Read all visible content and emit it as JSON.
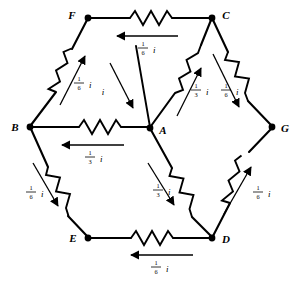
{
  "figure": {
    "type": "circuit-diagram",
    "background_color": "#ffffff",
    "line_color": "#000000"
  },
  "nodes": [
    {
      "id": "F",
      "label": "F",
      "x": 88,
      "y": 18,
      "label_dx": -13,
      "label_dy": -2
    },
    {
      "id": "C",
      "label": "C",
      "x": 212,
      "y": 18,
      "label_dx": 8,
      "label_dy": -2
    },
    {
      "id": "B",
      "label": "B",
      "x": 30,
      "y": 127,
      "label_dx": -13,
      "label_dy": 2
    },
    {
      "id": "A",
      "label": "A",
      "x": 150,
      "y": 128,
      "label_dx": 8,
      "label_dy": 4
    },
    {
      "id": "G",
      "label": "G",
      "x": 272,
      "y": 127,
      "label_dx": 8,
      "label_dy": 3
    },
    {
      "id": "E",
      "label": "E",
      "x": 88,
      "y": 238,
      "label_dx": -13,
      "label_dy": 2
    },
    {
      "id": "D",
      "label": "D",
      "x": 212,
      "y": 238,
      "label_dx": 8,
      "label_dy": 3
    }
  ],
  "branches": [
    {
      "name": "F-C",
      "from": "F",
      "to": "C",
      "current_num": "1",
      "current_den": "6",
      "current_symbol": "i",
      "direction": "C to F"
    },
    {
      "name": "B-F",
      "from": "B",
      "to": "F",
      "current_num": "1",
      "current_den": "6",
      "current_symbol": "i",
      "direction": "B to F"
    },
    {
      "name": "B-A",
      "from": "B",
      "to": "A",
      "current_num": "1",
      "current_den": "3",
      "current_symbol": "i",
      "direction": "A to B"
    },
    {
      "name": "A-C",
      "from": "A",
      "to": "C",
      "current_num": "1",
      "current_den": "3",
      "current_symbol": "i",
      "direction": "A to C"
    },
    {
      "name": "C-G",
      "from": "C",
      "to": "G",
      "current_num": "1",
      "current_den": "6",
      "current_symbol": "i",
      "direction": "C to G"
    },
    {
      "name": "B-E",
      "from": "B",
      "to": "E",
      "current_num": "1",
      "current_den": "6",
      "current_symbol": "i",
      "direction": "B to E"
    },
    {
      "name": "A-D",
      "from": "A",
      "to": "D",
      "current_num": "1",
      "current_den": "3",
      "current_symbol": "i",
      "direction": "A to D"
    },
    {
      "name": "D-G",
      "from": "D",
      "to": "G",
      "current_num": "1",
      "current_den": "6",
      "current_symbol": "i",
      "direction": "D to G"
    },
    {
      "name": "E-D",
      "from": "E",
      "to": "D",
      "current_num": "1",
      "current_den": "6",
      "current_symbol": "i",
      "direction": "D to E"
    }
  ],
  "source_lead": {
    "name": "input-lead-to-A",
    "current_symbol": "i",
    "direction": "into node A from upper left"
  },
  "labels": {
    "F": "F",
    "C": "C",
    "B": "B",
    "A": "A",
    "G": "G",
    "E": "E",
    "D": "D",
    "i": "i",
    "one": "1",
    "three": "3",
    "six": "6"
  }
}
